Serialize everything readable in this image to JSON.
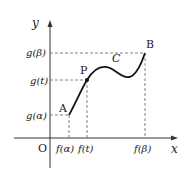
{
  "axes": {
    "x_label": "x",
    "y_label": "y",
    "origin_label": "O"
  },
  "points": {
    "A": "A",
    "P": "P",
    "B": "B"
  },
  "curve_label": "C",
  "x_ticks": {
    "f_alpha": "f(α)",
    "f_t": "f(t)",
    "f_beta": "f(β)"
  },
  "y_ticks": {
    "g_alpha": "g(α)",
    "g_t": "g(t)",
    "g_beta": "g(β)"
  }
}
